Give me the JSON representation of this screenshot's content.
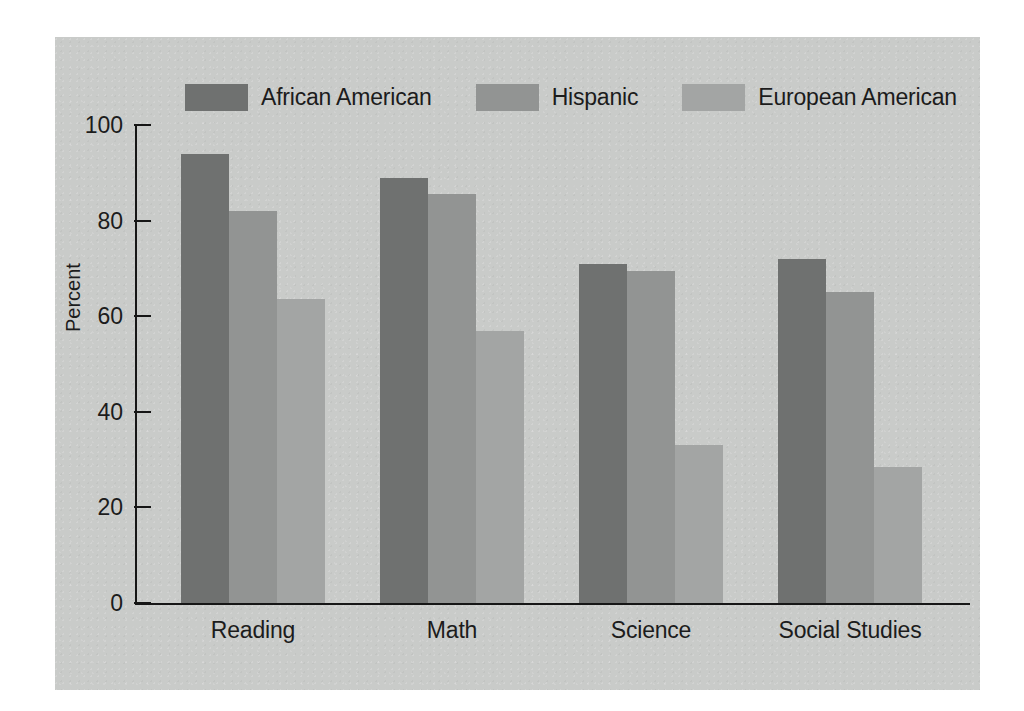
{
  "chart_data": {
    "type": "bar",
    "title": "",
    "subtitle": "",
    "xlabel": "",
    "ylabel": "Percent",
    "ylim": [
      0,
      100
    ],
    "yticks": [
      0,
      20,
      40,
      60,
      80,
      100
    ],
    "ytick_labels": [
      "0",
      "20",
      "40",
      "60",
      "80",
      "100"
    ],
    "grid": false,
    "legend_position": "top",
    "categories": [
      "Reading",
      "Math",
      "Science",
      "Social Studies"
    ],
    "series": [
      {
        "name": "African American",
        "color": "#6f7170",
        "values": [
          94,
          89,
          71,
          72
        ]
      },
      {
        "name": "Hispanic",
        "color": "#929493",
        "values": [
          82,
          85.5,
          69.5,
          65
        ]
      },
      {
        "name": "European American",
        "color": "#a3a5a4",
        "values": [
          63.5,
          57,
          33,
          28.5
        ]
      }
    ]
  },
  "figure": {
    "panel_color": "#c9cbc9",
    "page_color": "#ffffff",
    "axis_color": "#161616",
    "text_color": "#1c1c1c"
  }
}
